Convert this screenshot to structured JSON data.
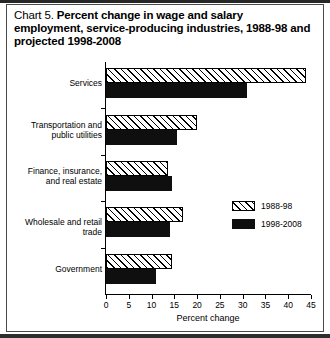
{
  "figure": {
    "title_prefix": "Chart 5.",
    "title_main": "Percent change in wage and salary employment, service-producing industries, 1988-98 and projected 1998-2008"
  },
  "chart_data": {
    "type": "bar",
    "orientation": "horizontal",
    "title": "Chart 5. Percent change in wage and salary employment, service-producing industries, 1988-98 and projected 1998-2008",
    "xlabel": "Percent change",
    "ylabel": "",
    "xlim": [
      0,
      45
    ],
    "xticks": [
      0,
      5,
      10,
      15,
      20,
      25,
      30,
      35,
      40,
      45
    ],
    "xtick_labels": [
      "0",
      "5",
      "10",
      "15",
      "20",
      "25",
      "30",
      "35",
      "40",
      "45"
    ],
    "grid": false,
    "legend_position": "center-right",
    "categories": [
      "Services",
      "Transportation and\npublic utilities",
      "Finance, insurance,\nand real estate",
      "Wholesale and retail trade",
      "Government"
    ],
    "series": [
      {
        "name": "1988-98",
        "fill": "hatched",
        "color": "#ffffff",
        "values": [
          44.0,
          20.0,
          13.5,
          17.0,
          14.5
        ]
      },
      {
        "name": "1998-2008",
        "fill": "solid",
        "color": "#100f0f",
        "values": [
          31.0,
          15.5,
          14.5,
          14.0,
          11.0
        ]
      }
    ]
  },
  "axis": {
    "x_title": "Percent change"
  },
  "legend": {
    "items": [
      {
        "label": "1988-98"
      },
      {
        "label": "1998-2008"
      }
    ]
  }
}
